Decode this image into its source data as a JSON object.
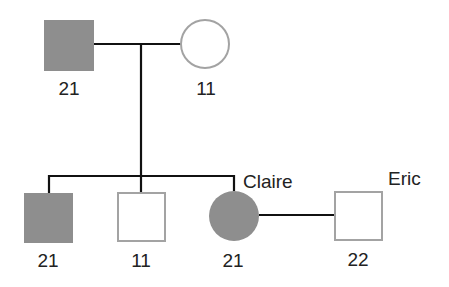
{
  "diagram": {
    "type": "pedigree",
    "colors": {
      "affected_fill": "#8e8e8e",
      "unaffected_outline": "#a3a3a3",
      "line": "#111111"
    },
    "generation1": {
      "father": {
        "sex": "male",
        "affected": true,
        "genotype": "21"
      },
      "mother": {
        "sex": "female",
        "affected": false,
        "genotype": "11"
      }
    },
    "generation2": {
      "children": [
        {
          "sex": "male",
          "affected": true,
          "genotype": "21"
        },
        {
          "sex": "male",
          "affected": false,
          "genotype": "11"
        },
        {
          "sex": "female",
          "affected": true,
          "genotype": "21",
          "name": "Claire"
        }
      ],
      "spouse": {
        "sex": "male",
        "affected": false,
        "genotype": "22",
        "name": "Eric"
      }
    }
  }
}
